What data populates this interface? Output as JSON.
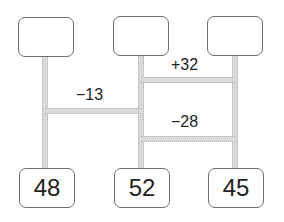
{
  "top_boxes": [
    {
      "value": ""
    },
    {
      "value": ""
    },
    {
      "value": ""
    }
  ],
  "bottom_boxes": [
    {
      "value": "48"
    },
    {
      "value": "52"
    },
    {
      "value": "45"
    }
  ],
  "connectors": [
    {
      "label": "−13",
      "from": 1,
      "to": 2
    },
    {
      "label": "+32",
      "from": 2,
      "to": 3
    },
    {
      "label": "−28",
      "from": 2,
      "to": 3
    }
  ]
}
